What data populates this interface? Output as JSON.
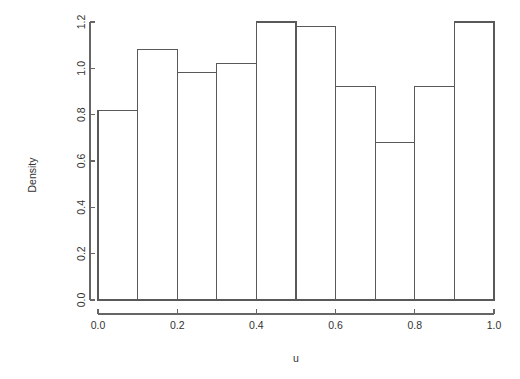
{
  "chart_data": {
    "type": "bar",
    "title": "",
    "subtitle": "",
    "xlabel": "u",
    "ylabel": "Density",
    "categories": [
      "0.0-0.1",
      "0.1-0.2",
      "0.2-0.3",
      "0.3-0.4",
      "0.4-0.5",
      "0.5-0.6",
      "0.6-0.7",
      "0.7-0.8",
      "0.8-0.9",
      "0.9-1.0"
    ],
    "bin_edges": [
      0.0,
      0.1,
      0.2,
      0.3,
      0.4,
      0.5,
      0.6,
      0.7,
      0.8,
      0.9,
      1.0
    ],
    "values": [
      0.82,
      1.08,
      0.98,
      1.02,
      1.2,
      1.18,
      0.92,
      0.68,
      0.92,
      1.2
    ],
    "xlim": [
      0.0,
      1.0
    ],
    "ylim": [
      0.0,
      1.2
    ],
    "xticks": [
      0.0,
      0.2,
      0.4,
      0.6,
      0.8,
      1.0
    ],
    "xtick_labels": [
      "0.0",
      "0.2",
      "0.4",
      "0.6",
      "0.8",
      "1.0"
    ],
    "yticks": [
      0.0,
      0.2,
      0.4,
      0.6,
      0.8,
      1.0,
      1.2
    ],
    "ytick_labels": [
      "0.0",
      "0.2",
      "0.4",
      "0.6",
      "0.8",
      "1.0",
      "1.2"
    ],
    "grid": false,
    "legend": null,
    "legend_position": "none",
    "bar_fill_color": "#ffffff",
    "bar_stroke_color": "#595959",
    "axis_color": "#666666",
    "background_color": "#ffffff",
    "text_color": "#333333",
    "annotations": []
  }
}
